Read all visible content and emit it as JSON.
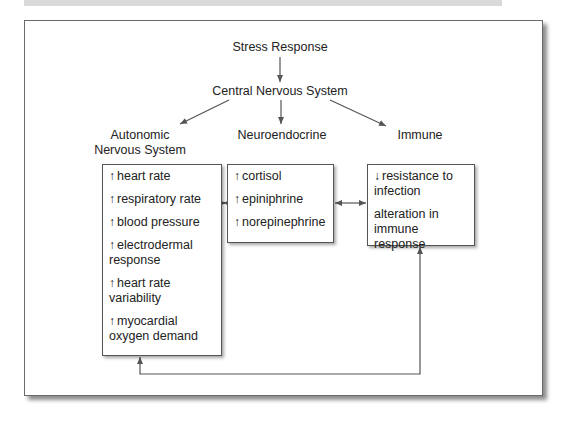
{
  "title": "Stress Response",
  "center": "Central Nervous System",
  "branches": {
    "autonomic": {
      "header_line1": "Autonomic",
      "header_line2": "Nervous System",
      "items": [
        {
          "dir": "↑",
          "text": "heart rate"
        },
        {
          "dir": "↑",
          "text": "respiratory rate"
        },
        {
          "dir": "↑",
          "text": "blood pressure"
        },
        {
          "dir": "↑",
          "text": "electrodermal",
          "text2": "response"
        },
        {
          "dir": "↑",
          "text": "heart rate",
          "text2": "variability"
        },
        {
          "dir": "↑",
          "text": "myocardial",
          "text2": "oxygen demand"
        }
      ]
    },
    "neuroendocrine": {
      "header": "Neuroendocrine",
      "items": [
        {
          "dir": "↑",
          "text": "cortisol"
        },
        {
          "dir": "↑",
          "text": "epiniphrine"
        },
        {
          "dir": "↑",
          "text": "norepinephrine"
        }
      ]
    },
    "immune": {
      "header": "Immune",
      "items": [
        {
          "dir": "↓",
          "text": "resistance to",
          "text2": "infection"
        },
        {
          "dir": "",
          "text": "alteration in",
          "text2": "immune response"
        }
      ]
    }
  },
  "connections": [
    {
      "from": "Stress Response",
      "to": "Central Nervous System",
      "type": "arrow"
    },
    {
      "from": "Central Nervous System",
      "to": "Autonomic Nervous System",
      "type": "arrow"
    },
    {
      "from": "Central Nervous System",
      "to": "Neuroendocrine",
      "type": "arrow"
    },
    {
      "from": "Central Nervous System",
      "to": "Immune",
      "type": "arrow"
    },
    {
      "from": "Autonomic Nervous System",
      "to": "Neuroendocrine",
      "type": "bidirectional"
    },
    {
      "from": "Neuroendocrine",
      "to": "Immune",
      "type": "bidirectional"
    },
    {
      "from": "Immune",
      "to": "Autonomic Nervous System",
      "type": "bidirectional-loop"
    }
  ],
  "colors": {
    "line": "#555555",
    "frame": "#6a6a6a",
    "topbar": "#d9d9d9"
  }
}
